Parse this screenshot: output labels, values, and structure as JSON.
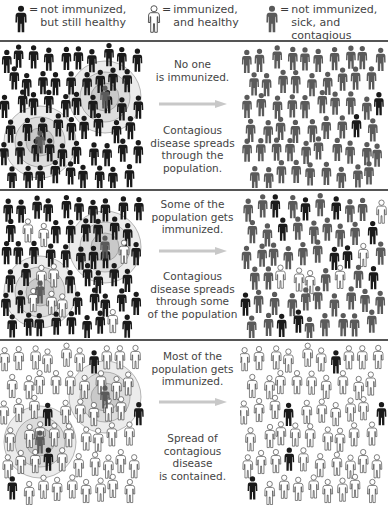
{
  "legend": {
    "items": [
      {
        "kind": "dark",
        "text": "not immunized,\nbut still healthy",
        "x": 14
      },
      {
        "kind": "white",
        "text": "immunized,\nand healthy",
        "x": 147
      },
      {
        "kind": "sick",
        "text": "not immunized,\nsick, and contagious",
        "x": 265
      }
    ],
    "equals": "="
  },
  "colors": {
    "dark": "#1a1a1a",
    "sick": "#5a5a5a",
    "white_fill": "#ffffff",
    "white_stroke": "#333333",
    "ring": "#cfcfcf",
    "ring_line": "#888888",
    "arrow": "#c8c8c8",
    "divider": "#555555"
  },
  "panels": [
    {
      "id": "none-immunized",
      "top": 42,
      "height": 146,
      "caption_top": "No one\nis immunized.",
      "caption_bottom": "Contagious\ndisease spreads\nthrough the\npopulation.",
      "caption_top_y": 16,
      "arrow_y": 58,
      "caption_bottom_y": 82,
      "immunized_ratio": 0.0,
      "left_sick": [
        [
          13,
          6
        ],
        [
          4,
          8
        ]
      ],
      "right_sick_all": true
    },
    {
      "id": "some-immunized",
      "top": 192,
      "height": 146,
      "caption_top": "Some of the\npopulation gets\nimmunized.",
      "caption_top_y": 6,
      "arrow_y": 55,
      "caption_bottom": "Contagious\ndisease spreads\nthrough some\nof the population",
      "caption_bottom_y": 78,
      "immunized_ratio": 0.12,
      "left_sick": [
        [
          13,
          5
        ],
        [
          4,
          8
        ]
      ],
      "right_sick_all": true
    },
    {
      "id": "most-immunized",
      "top": 342,
      "height": 163,
      "caption_top": "Most of the\npopulation gets\nimmunized.",
      "caption_top_y": 8,
      "arrow_y": 56,
      "caption_bottom": "Spread of\ncontagious disease\nis contained.",
      "caption_bottom_y": 90,
      "immunized_ratio": 0.9,
      "left_sick": [
        [
          13,
          5
        ],
        [
          4,
          8
        ]
      ],
      "right_sick_all": false
    }
  ]
}
